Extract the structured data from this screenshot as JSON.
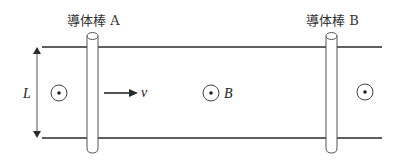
{
  "figure": {
    "rod_a_label": "導体棒 A",
    "rod_b_label": "導体棒 B",
    "length_label": "L",
    "velocity_label": "v",
    "field_label": "B",
    "field_symbols": [
      {
        "cx": 59,
        "cy": 93
      },
      {
        "cx": 211,
        "cy": 93
      },
      {
        "cx": 365,
        "cy": 92
      }
    ],
    "colors": {
      "line": "#2a2a2a",
      "rod_outline": "#555555",
      "text": "#333333"
    }
  }
}
